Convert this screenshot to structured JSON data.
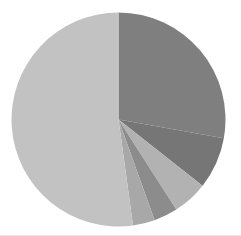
{
  "chart_data": {
    "type": "pie",
    "title": "",
    "subtitle": "",
    "xlabel": "",
    "ylabel": "",
    "grid": false,
    "legend": "none",
    "start_angle_deg": 0,
    "direction": "clockwise",
    "center": {
      "cx": 118.5,
      "cy": 119.5,
      "r": 107
    },
    "background": "#ffffff",
    "categories": [
      "Slice 1",
      "Slice 2",
      "Slice 3",
      "Slice 4",
      "Slice 5",
      "Slice 6"
    ],
    "values": [
      27.8,
      7.8,
      5.3,
      3.6,
      3.3,
      52.2
    ],
    "labels": [],
    "annotations": [],
    "slices": [
      {
        "name": "Slice 1",
        "value": 27.8,
        "percent": 27.8,
        "color": "#7f7f7f",
        "start_deg": 0,
        "end_deg": 100.1
      },
      {
        "name": "Slice 2",
        "value": 7.8,
        "percent": 7.8,
        "color": "#767676",
        "start_deg": 100.1,
        "end_deg": 128.2
      },
      {
        "name": "Slice 3",
        "value": 5.3,
        "percent": 5.3,
        "color": "#b2b2b2",
        "start_deg": 128.2,
        "end_deg": 147.3
      },
      {
        "name": "Slice 4",
        "value": 3.6,
        "percent": 3.6,
        "color": "#8c8c8c",
        "start_deg": 147.3,
        "end_deg": 160.3
      },
      {
        "name": "Slice 5",
        "value": 3.3,
        "percent": 3.3,
        "color": "#a8a8a8",
        "start_deg": 160.3,
        "end_deg": 172.2
      },
      {
        "name": "Slice 6",
        "value": 52.2,
        "percent": 52.2,
        "color": "#c2c2c2",
        "start_deg": 172.2,
        "end_deg": 360
      }
    ]
  }
}
